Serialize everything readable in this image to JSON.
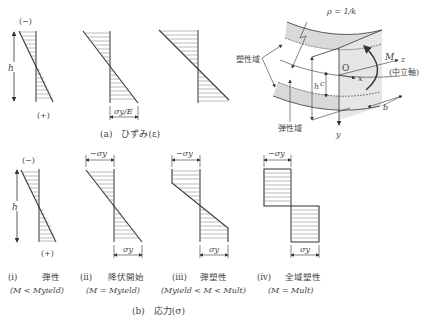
{
  "figure": {
    "strain_panel": {
      "caption": "(a)　ひずみ(ε)",
      "sign_top": "(−)",
      "sign_bottom": "(+)",
      "height_label": "h",
      "yield_strain_label": "σy/E"
    },
    "beam_3d": {
      "radius_label": "ρ = 1/k",
      "plastic_zone_label": "塑性域",
      "elastic_zone_label": "弾性域",
      "moment_label": "M",
      "origin_label": "O",
      "axis_x": "x",
      "axis_y": "y",
      "axis_z": "z",
      "neutral_axis_label": "(中立軸)",
      "height_label": "h",
      "core_label": "c",
      "width_label": "b"
    },
    "stress_panel": {
      "caption": "(b)　応力(σ)",
      "sign_top": "(−)",
      "sign_bottom": "(+)",
      "height_label": "h",
      "neg_yield_label": "−σy",
      "pos_yield_label": "σy",
      "cases": [
        {
          "numeral": "(ⅰ)",
          "name": "弾性",
          "condition": "(M < Myield)"
        },
        {
          "numeral": "(ⅱ)",
          "name": "降伏開始",
          "condition": "(M = Myield)"
        },
        {
          "numeral": "(ⅲ)",
          "name": "弾塑性",
          "condition": "(Myield < M < Mult)"
        },
        {
          "numeral": "(ⅳ)",
          "name": "全域塑性",
          "condition": "(M = Mult)"
        }
      ]
    },
    "colors": {
      "line": "#333333",
      "shade": "#d9d9d9",
      "hatch": "#666666"
    }
  }
}
